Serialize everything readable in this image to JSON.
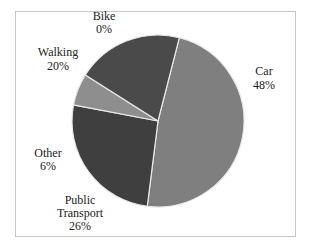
{
  "chart_data": {
    "type": "pie",
    "title": "",
    "slices": [
      {
        "label": "Car",
        "value": 48,
        "pct_label": "48%",
        "color": "#7f7f7f"
      },
      {
        "label": "Public Transport",
        "value": 26,
        "pct_label": "26%",
        "color": "#3f3f3f"
      },
      {
        "label": "Other",
        "value": 6,
        "pct_label": "6%",
        "color": "#8e8e8e"
      },
      {
        "label": "Walking",
        "value": 20,
        "pct_label": "20%",
        "color": "#4a4a4a"
      },
      {
        "label": "Bike",
        "value": 0,
        "pct_label": "0%",
        "color": "#6a6a6a"
      }
    ],
    "legend": "none",
    "data_labels": "outside"
  }
}
